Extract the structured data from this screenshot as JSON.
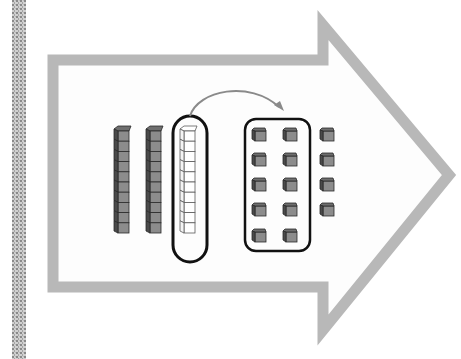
{
  "diagram": {
    "title": "",
    "colors": {
      "background": "#ffffff",
      "arrow_outline": "#b8b8b8",
      "edge_strip": "#9a9a9a",
      "block_fill": "#8c8c8c",
      "block_top": "#6e6e6e",
      "block_side": "#4a4a4a",
      "block_stroke": "#2a2a2a",
      "highlighted_rod_fill": "#ffffff",
      "group_outline": "#111111",
      "curved_arrow": "#8a8a8a"
    },
    "shapes": {
      "big_arrow": {
        "label": "right-pointing block arrow outline"
      },
      "tens_rods_shaded": {
        "count": 2,
        "cubes_per_rod": 10
      },
      "highlighted_rod": {
        "count": 1,
        "cubes_per_rod": 10,
        "style": "white / outlined"
      },
      "curved_arrow": {
        "from": "highlighted rod",
        "to": "group of ten units"
      },
      "grouped_units": {
        "columns": 2,
        "rows": 5,
        "count": 10
      },
      "extra_units": {
        "columns": 1,
        "rows": 4,
        "count": 4
      }
    },
    "totals": {
      "tens_before": 3,
      "tens_after": 2,
      "ones_after": 14
    }
  }
}
